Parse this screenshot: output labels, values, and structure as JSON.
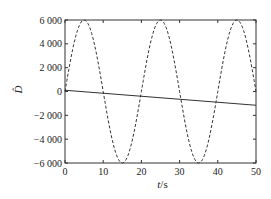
{
  "chart_data": {
    "type": "line",
    "title": "",
    "xlabel": "t/s",
    "xlabel_italic_part": "t",
    "xlabel_unit": "/s",
    "ylabel": "D̂",
    "xlim": [
      0,
      50
    ],
    "ylim": [
      -6000,
      6000
    ],
    "x_ticks": [
      0,
      10,
      20,
      30,
      40,
      50
    ],
    "y_ticks": [
      6000,
      4000,
      2000,
      0,
      -2000,
      -4000,
      -6000
    ],
    "x_tick_labels": [
      "0",
      "10",
      "20",
      "30",
      "40",
      "50"
    ],
    "y_tick_labels": [
      "6 000",
      "4 000",
      "2 000",
      "0",
      "−2 000",
      "−4 000",
      "−6 000"
    ],
    "grid": false,
    "legend": null,
    "series": [
      {
        "name": "dashed oscillation",
        "style": "dashed",
        "x": [
          0,
          5,
          10,
          15,
          20,
          25,
          30,
          35,
          40,
          45,
          50
        ],
        "values": [
          0,
          6000,
          0,
          -6000,
          0,
          6000,
          0,
          -6000,
          0,
          6000,
          0
        ],
        "description": "sinusoid, amplitude 6000, period 20 s"
      },
      {
        "name": "solid trend",
        "style": "solid",
        "x": [
          0,
          10,
          20,
          30,
          40,
          50
        ],
        "values": [
          100,
          -150,
          -400,
          -650,
          -900,
          -1150
        ]
      }
    ]
  }
}
